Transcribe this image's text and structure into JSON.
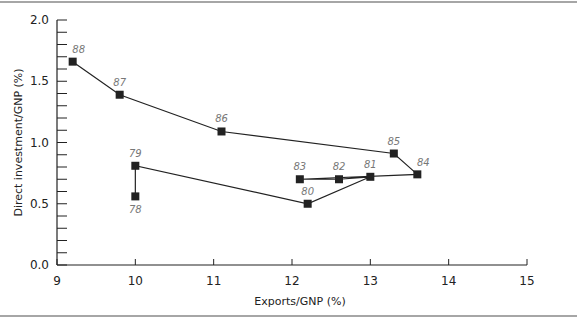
{
  "chart_data": {
    "type": "line",
    "title": "",
    "xlabel": "Exports/GNP (%)",
    "ylabel": "Direct investment/GNP (%)",
    "xlim": [
      9,
      15
    ],
    "ylim": [
      0.0,
      2.0
    ],
    "x_ticks": [
      "9",
      "10",
      "11",
      "12",
      "13",
      "14",
      "15"
    ],
    "y_ticks": [
      "0.0",
      "0.5",
      "1.0",
      "1.5",
      "2.0"
    ],
    "grid": false,
    "legend": null,
    "series": [
      {
        "name": "Direct investment vs exports by year",
        "points": [
          {
            "label": "78",
            "x": 10.0,
            "y": 0.56
          },
          {
            "label": "79",
            "x": 10.0,
            "y": 0.81
          },
          {
            "label": "80",
            "x": 12.2,
            "y": 0.5
          },
          {
            "label": "81",
            "x": 13.0,
            "y": 0.72
          },
          {
            "label": "82",
            "x": 12.6,
            "y": 0.7
          },
          {
            "label": "83",
            "x": 12.1,
            "y": 0.7
          },
          {
            "label": "84",
            "x": 13.6,
            "y": 0.74
          },
          {
            "label": "85",
            "x": 13.3,
            "y": 0.91
          },
          {
            "label": "86",
            "x": 11.1,
            "y": 1.09
          },
          {
            "label": "87",
            "x": 9.8,
            "y": 1.39
          },
          {
            "label": "88",
            "x": 9.2,
            "y": 1.66
          }
        ]
      }
    ]
  }
}
